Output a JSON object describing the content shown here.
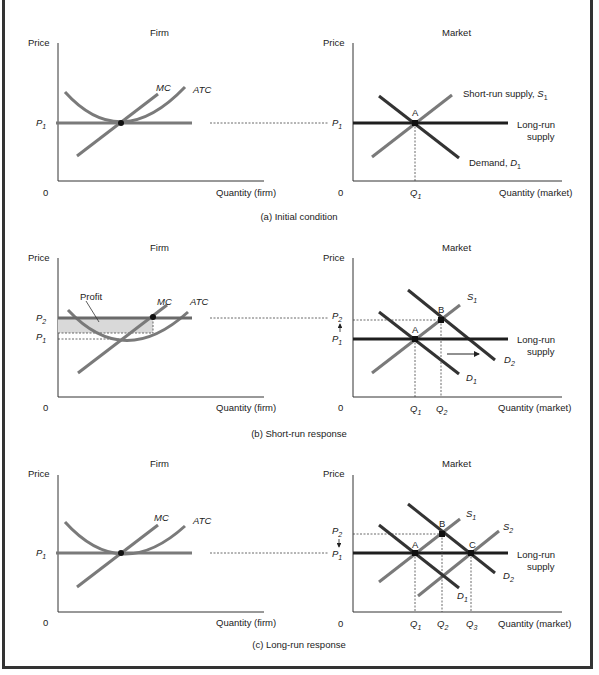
{
  "figure": {
    "panels": [
      {
        "caption": "(a) Initial condition",
        "firm": {
          "title": "Firm",
          "ylabel": "Price",
          "xlabel": "Quantity (firm)",
          "origin": "0",
          "price_labels": [
            {
              "main": "P",
              "sub": "1"
            }
          ],
          "curves": {
            "mc": "MC",
            "atc": "ATC"
          }
        },
        "market": {
          "title": "Market",
          "ylabel": "Price",
          "xlabel": "Quantity (market)",
          "origin": "0",
          "price_labels": [
            {
              "main": "P",
              "sub": "1"
            }
          ],
          "qty_labels": [
            {
              "main": "Q",
              "sub": "1"
            }
          ],
          "points": [
            "A"
          ],
          "curve_labels": {
            "short_run_supply": "Short-run supply, ",
            "short_run_supply_sym": "S",
            "short_run_supply_sub": "1",
            "long_run_1": "Long-run",
            "long_run_2": "supply",
            "demand": "Demand, ",
            "demand_sym": "D",
            "demand_sub": "1"
          }
        }
      },
      {
        "caption": "(b) Short-run response",
        "firm": {
          "title": "Firm",
          "ylabel": "Price",
          "xlabel": "Quantity (firm)",
          "origin": "0",
          "price_labels": [
            {
              "main": "P",
              "sub": "2"
            },
            {
              "main": "P",
              "sub": "1"
            }
          ],
          "profit_label": "Profit",
          "curves": {
            "mc": "MC",
            "atc": "ATC"
          }
        },
        "market": {
          "title": "Market",
          "ylabel": "Price",
          "xlabel": "Quantity (market)",
          "origin": "0",
          "price_labels": [
            {
              "main": "P",
              "sub": "2"
            },
            {
              "main": "P",
              "sub": "1"
            }
          ],
          "qty_labels": [
            {
              "main": "Q",
              "sub": "1"
            },
            {
              "main": "Q",
              "sub": "2"
            }
          ],
          "points": [
            "A",
            "B"
          ],
          "curve_labels": {
            "s1": "S",
            "s1_sub": "1",
            "d1": "D",
            "d1_sub": "1",
            "d2": "D",
            "d2_sub": "2",
            "long_run_1": "Long-run",
            "long_run_2": "supply"
          }
        }
      },
      {
        "caption": "(c) Long-run response",
        "firm": {
          "title": "Firm",
          "ylabel": "Price",
          "xlabel": "Quantity (firm)",
          "origin": "0",
          "price_labels": [
            {
              "main": "P",
              "sub": "1"
            }
          ],
          "curves": {
            "mc": "MC",
            "atc": "ATC"
          }
        },
        "market": {
          "title": "Market",
          "ylabel": "Price",
          "xlabel": "Quantity (market)",
          "origin": "0",
          "price_labels": [
            {
              "main": "P",
              "sub": "2"
            },
            {
              "main": "P",
              "sub": "1"
            }
          ],
          "qty_labels": [
            {
              "main": "Q",
              "sub": "1"
            },
            {
              "main": "Q",
              "sub": "2"
            },
            {
              "main": "Q",
              "sub": "3"
            }
          ],
          "points": [
            "A",
            "B",
            "C"
          ],
          "curve_labels": {
            "s1": "S",
            "s1_sub": "1",
            "s2": "S",
            "s2_sub": "2",
            "d1": "D",
            "d1_sub": "1",
            "d2": "D",
            "d2_sub": "2",
            "long_run_1": "Long-run",
            "long_run_2": "supply"
          }
        }
      }
    ]
  },
  "colors": {
    "curve": "#7a7a7a",
    "long_run_supply": "#1e1e1e",
    "axis": "#333333",
    "profit_fill": "#d9d9d9",
    "point": "#111111",
    "border": "#333333"
  }
}
